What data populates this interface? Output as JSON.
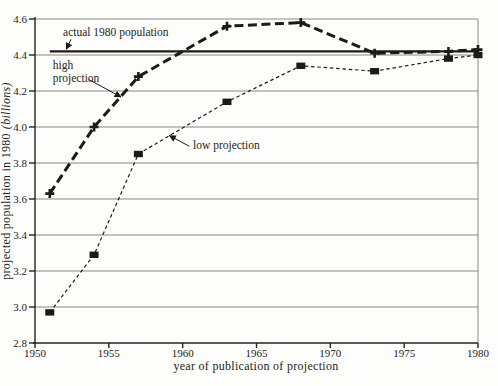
{
  "figure": {
    "background": "#fdfdfb",
    "ink": "#1c1b17",
    "grid_color": "#8a887f",
    "text_color": "#24221d"
  },
  "chart_data": {
    "type": "line",
    "title": "",
    "xlabel": "year of publication of projection",
    "ylabel": "projected population in 1980",
    "ylabel_unit": "(billions)",
    "xlim": [
      1950,
      1980
    ],
    "ylim": [
      2.8,
      4.6
    ],
    "x_ticks": [
      1950,
      1955,
      1960,
      1965,
      1970,
      1975,
      1980
    ],
    "y_ticks": [
      2.8,
      3.0,
      3.2,
      3.4,
      3.6,
      3.8,
      4.0,
      4.2,
      4.4,
      4.6
    ],
    "grid": "horizontal gridlines at every y tick; plot boxed with right border",
    "legend_position": "inline annotations with arrows",
    "series": [
      {
        "name": "high projection",
        "style": "heavy-dashed",
        "marker": "plus",
        "x": [
          1951,
          1954,
          1957,
          1963,
          1968,
          1973,
          1978,
          1980
        ],
        "values": [
          3.63,
          4.0,
          4.28,
          4.56,
          4.58,
          4.41,
          4.42,
          4.43
        ]
      },
      {
        "name": "low projection",
        "style": "fine-dashed",
        "marker": "square",
        "x": [
          1951,
          1954,
          1957,
          1963,
          1968,
          1973,
          1978,
          1980
        ],
        "values": [
          2.97,
          3.29,
          3.85,
          4.14,
          4.34,
          4.31,
          4.38,
          4.4
        ]
      },
      {
        "name": "actual 1980 population",
        "style": "solid",
        "marker": "none",
        "x": [
          1951,
          1980
        ],
        "values": [
          4.42,
          4.42
        ]
      }
    ],
    "annotations": [
      {
        "id": "actual-1980-population",
        "lines": [
          "actual 1980 population"
        ],
        "x": 1951.9,
        "y": 4.506,
        "arrow": {
          "x1": 1952.44,
          "y1": 4.487,
          "x2": 1952.12,
          "y2": 4.432
        }
      },
      {
        "id": "high-projection",
        "lines": [
          "high",
          "projection"
        ],
        "x": 1951.2,
        "y": 4.32,
        "arrow": {
          "x1": 1953.66,
          "y1": 4.263,
          "x2": 1955.82,
          "y2": 4.167
        }
      },
      {
        "id": "low-projection",
        "lines": [
          "low projection"
        ],
        "x": 1960.7,
        "y": 3.878,
        "arrow": {
          "x1": 1960.45,
          "y1": 3.893,
          "x2": 1959.1,
          "y2": 3.952
        }
      }
    ]
  }
}
